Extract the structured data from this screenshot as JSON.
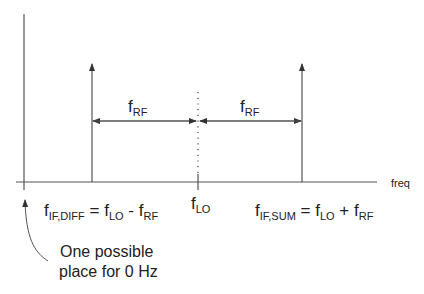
{
  "diagram": {
    "type": "frequency-spectrum",
    "axis_label_x": "freq",
    "colors": {
      "line": "#555555",
      "text": "#222222",
      "background": "#ffffff"
    },
    "spikes": [
      {
        "id": "if-diff",
        "label_main": "f",
        "label_sub": "IF,DIFF"
      },
      {
        "id": "lo",
        "label_main": "f",
        "label_sub": "LO"
      },
      {
        "id": "if-sum",
        "label_main": "f",
        "label_sub": "IF,SUM"
      }
    ],
    "spacing_labels": [
      {
        "main": "f",
        "sub": "RF"
      },
      {
        "main": "f",
        "sub": "RF"
      }
    ],
    "equations": {
      "diff": {
        "lhs_main": "f",
        "lhs_sub": "IF,DIFF",
        "eq": " = ",
        "a_main": "f",
        "a_sub": "LO",
        "op": " - ",
        "b_main": "f",
        "b_sub": "RF"
      },
      "sum": {
        "lhs_main": "f",
        "lhs_sub": "IF,SUM",
        "eq": " = ",
        "a_main": "f",
        "a_sub": "LO",
        "op": " + ",
        "b_main": "f",
        "b_sub": "RF"
      }
    },
    "annotation": {
      "line1": "One possible",
      "line2": "place for 0 Hz"
    }
  }
}
